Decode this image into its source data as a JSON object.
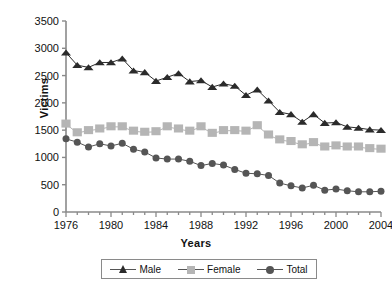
{
  "chart_data": {
    "type": "line",
    "title": "",
    "xlabel": "Years",
    "ylabel": "Victims",
    "xlim": [
      1976,
      2004
    ],
    "ylim": [
      0,
      3500
    ],
    "ytick_step": 500,
    "yticks": [
      "0",
      "500",
      "1000",
      "1500",
      "2000",
      "2500",
      "3000",
      "3500"
    ],
    "xticks_labeled": [
      "1976",
      "1980",
      "1984",
      "1988",
      "1992",
      "1996",
      "2000",
      "2004"
    ],
    "xtick_minor_every": 1,
    "grid": false,
    "legend_position": "bottom",
    "x": [
      1976,
      1977,
      1978,
      1979,
      1980,
      1981,
      1982,
      1983,
      1984,
      1985,
      1986,
      1987,
      1988,
      1989,
      1990,
      1991,
      1992,
      1993,
      1994,
      1995,
      1996,
      1997,
      1998,
      1999,
      2000,
      2001,
      2002,
      2003,
      2004
    ],
    "series": [
      {
        "name": "Male",
        "color": "#2b2b2b",
        "marker": "triangle",
        "values": [
          2920,
          2690,
          2650,
          2740,
          2740,
          2810,
          2590,
          2560,
          2400,
          2470,
          2540,
          2390,
          2410,
          2290,
          2350,
          2310,
          2140,
          2240,
          2040,
          1830,
          1790,
          1650,
          1790,
          1630,
          1640,
          1560,
          1540,
          1510,
          1500
        ]
      },
      {
        "name": "Female",
        "color": "#b5b5b5",
        "marker": "square",
        "values": [
          1610,
          1450,
          1490,
          1520,
          1560,
          1560,
          1480,
          1460,
          1470,
          1560,
          1520,
          1480,
          1560,
          1440,
          1490,
          1490,
          1480,
          1580,
          1410,
          1320,
          1290,
          1230,
          1270,
          1190,
          1210,
          1190,
          1190,
          1160,
          1150
        ]
      },
      {
        "name": "Total",
        "color": "#555555",
        "marker": "circle",
        "values": [
          1340,
          1280,
          1190,
          1250,
          1210,
          1260,
          1150,
          1100,
          990,
          970,
          970,
          930,
          850,
          890,
          860,
          780,
          710,
          700,
          670,
          530,
          480,
          440,
          490,
          400,
          420,
          390,
          370,
          370,
          380
        ]
      }
    ]
  },
  "legend": {
    "items": [
      {
        "label": "Male",
        "marker": "triangle-icon"
      },
      {
        "label": "Female",
        "marker": "square-icon"
      },
      {
        "label": "Total",
        "marker": "circle-icon"
      }
    ]
  }
}
